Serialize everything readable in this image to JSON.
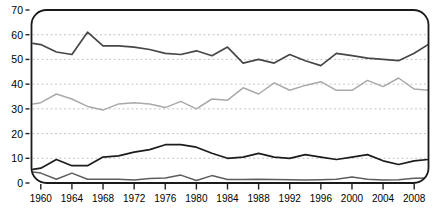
{
  "chart_data": {
    "type": "line",
    "title": "",
    "xlabel": "",
    "ylabel": "",
    "legend": "none",
    "grid": "horizontal-dashed",
    "ylim": [
      0,
      70
    ],
    "xlim": [
      1959,
      2010
    ],
    "y_ticks": [
      0,
      10,
      20,
      30,
      40,
      50,
      60,
      70
    ],
    "y_tick_labels": [
      "0",
      "10",
      "20",
      "30",
      "40",
      "50",
      "60",
      "70"
    ],
    "x_ticks": [
      1960,
      1964,
      1968,
      1972,
      1976,
      1980,
      1984,
      1988,
      1992,
      1996,
      2000,
      2004,
      2008
    ],
    "x_tick_labels": [
      "1960",
      "1964",
      "1968",
      "1972",
      "1976",
      "1980",
      "1984",
      "1988",
      "1992",
      "1996",
      "2000",
      "2004",
      "2008"
    ],
    "x": [
      1959,
      1960,
      1962,
      1964,
      1966,
      1968,
      1970,
      1972,
      1974,
      1976,
      1978,
      1980,
      1982,
      1984,
      1986,
      1988,
      1990,
      1992,
      1994,
      1996,
      1998,
      2000,
      2002,
      2004,
      2006,
      2008,
      2010
    ],
    "series": [
      {
        "name": "series-1-dark-gray-upper",
        "color": "#474747",
        "stroke_width": 1.7,
        "values": [
          56.5,
          56,
          53,
          52,
          61,
          55.5,
          55.5,
          55,
          54,
          52.5,
          52,
          53.5,
          51.5,
          55,
          48.5,
          50,
          48.5,
          52,
          49.5,
          47.5,
          52.5,
          51.5,
          50.5,
          50,
          49.5,
          52.5,
          56
        ]
      },
      {
        "name": "series-2-light-gray-middle",
        "color": "#a9a9a9",
        "stroke_width": 1.5,
        "values": [
          32,
          32.5,
          36,
          34,
          31,
          29.5,
          32,
          32.5,
          32,
          30.5,
          33,
          30,
          34,
          33.5,
          38.5,
          36,
          40.5,
          37.5,
          39.5,
          41,
          37.5,
          37.5,
          41.5,
          39,
          42.5,
          38,
          37.5
        ]
      },
      {
        "name": "series-3-black-lower",
        "color": "#1c1c1c",
        "stroke_width": 1.7,
        "values": [
          5.5,
          6,
          9.5,
          7,
          7,
          10.5,
          11,
          12.5,
          13.5,
          15.5,
          15.5,
          14.5,
          12,
          10,
          10.5,
          12,
          10.5,
          10,
          11.5,
          10.5,
          9.5,
          10.5,
          11.5,
          9,
          7.5,
          9,
          9.5
        ]
      },
      {
        "name": "series-4-gray-bottom",
        "color": "#5d5d5d",
        "stroke_width": 1.5,
        "values": [
          4.5,
          4,
          1.5,
          4,
          1.5,
          1.5,
          1.5,
          1.2,
          1.8,
          2,
          3.2,
          1,
          3,
          1.4,
          1.4,
          1.5,
          1.4,
          1.3,
          1.2,
          1.3,
          1.5,
          2.4,
          1.5,
          1.2,
          1.3,
          1.9,
          2
        ]
      }
    ],
    "frame": {
      "border_color": "#1a1a1a",
      "corner_radius": 15,
      "gridline_color": "#c6c6c6",
      "tick_color": "#222222"
    }
  }
}
